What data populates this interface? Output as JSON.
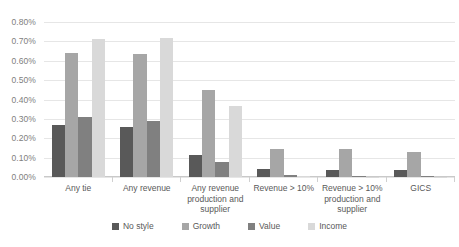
{
  "chart_data": {
    "type": "bar",
    "title": "",
    "subtitle": "",
    "xlabel": "",
    "ylabel": "",
    "ylim": [
      0,
      0.008
    ],
    "grid": true,
    "legend_position": "bottom",
    "tick_format": "percent-2dp",
    "categories": [
      "Any tie",
      "Any revenue",
      "Any revenue production and supplier",
      "Revenue > 10%",
      "Revenue > 10% production and supplier",
      "GICS"
    ],
    "ytick_labels": [
      "0.00%",
      "0.10%",
      "0.20%",
      "0.30%",
      "0.40%",
      "0.50%",
      "0.60%",
      "0.70%",
      "0.80%"
    ],
    "ytick_values": [
      0.0,
      0.001,
      0.002,
      0.003,
      0.004,
      0.005,
      0.006,
      0.007,
      0.008
    ],
    "series": [
      {
        "name": "No style",
        "color": "#595959",
        "values": [
          0.0027,
          0.0026,
          0.00115,
          0.0004,
          0.00035,
          0.00035
        ],
        "values_pct": [
          "0.27%",
          "0.26%",
          "0.115%",
          "0.04%",
          "0.035%",
          "0.035%"
        ]
      },
      {
        "name": "Growth",
        "color": "#a6a6a6",
        "values": [
          0.0064,
          0.00635,
          0.0045,
          0.00145,
          0.00145,
          0.0013
        ],
        "values_pct": [
          "0.64%",
          "0.635%",
          "0.45%",
          "0.145%",
          "0.145%",
          "0.13%"
        ]
      },
      {
        "name": "Value",
        "color": "#808080",
        "values": [
          0.0031,
          0.0029,
          0.00075,
          0.0001,
          3e-05,
          3e-05
        ],
        "values_pct": [
          "0.31%",
          "0.29%",
          "0.075%",
          "0.01%",
          "0.003%",
          "0.003%"
        ]
      },
      {
        "name": "Income",
        "color": "#d9d9d9",
        "values": [
          0.0071,
          0.00715,
          0.00365,
          4e-05,
          2e-05,
          2e-05
        ],
        "values_pct": [
          "0.71%",
          "0.715%",
          "0.365%",
          "0.004%",
          "0.002%",
          "0.002%"
        ]
      }
    ]
  },
  "axis": {
    "y_max_label": "0.80%",
    "y_min_label": "0.00%"
  },
  "legend": {
    "items": [
      {
        "label": "No style",
        "color": "#595959"
      },
      {
        "label": "Growth",
        "color": "#a6a6a6"
      },
      {
        "label": "Value",
        "color": "#808080"
      },
      {
        "label": "Income",
        "color": "#d9d9d9"
      }
    ]
  }
}
